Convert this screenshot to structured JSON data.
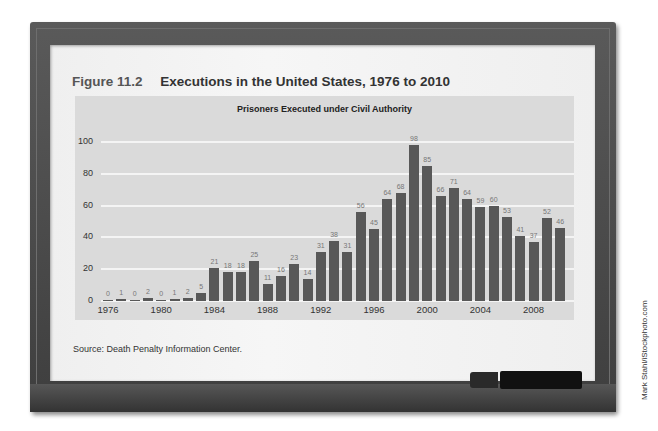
{
  "figure": {
    "number": "Figure 11.2",
    "title": "Executions in the United States, 1976 to 2010"
  },
  "source": "Source: Death Penalty Information Center.",
  "credit": "Mark Stahl/iStockphoto.com",
  "colors": {
    "bar": "#585858",
    "panel": "#dadada",
    "gridline": "#f4f4f4",
    "frame": "#4a4a4a"
  },
  "chart_data": {
    "type": "bar",
    "title": "Prisoners Executed under Civil Authority",
    "xlabel": "",
    "ylabel": "",
    "ylim": [
      0,
      100
    ],
    "yticks": [
      0,
      20,
      40,
      60,
      80,
      100
    ],
    "grid": true,
    "legend": null,
    "categories": [
      "1976",
      "1977",
      "1978",
      "1979",
      "1980",
      "1981",
      "1982",
      "1983",
      "1984",
      "1985",
      "1986",
      "1987",
      "1988",
      "1989",
      "1990",
      "1991",
      "1992",
      "1993",
      "1994",
      "1995",
      "1996",
      "1997",
      "1998",
      "1999",
      "2000",
      "2001",
      "2002",
      "2003",
      "2004",
      "2005",
      "2006",
      "2007",
      "2008",
      "2009",
      "2010"
    ],
    "values": [
      0,
      1,
      0,
      2,
      0,
      1,
      2,
      5,
      21,
      18,
      18,
      25,
      11,
      16,
      23,
      14,
      31,
      38,
      31,
      56,
      45,
      64,
      68,
      98,
      85,
      66,
      71,
      64,
      59,
      60,
      53,
      41,
      37,
      52,
      46
    ],
    "xtick_labels": [
      "1976",
      "1980",
      "1984",
      "1988",
      "1992",
      "1996",
      "2000",
      "2004",
      "2008"
    ]
  }
}
